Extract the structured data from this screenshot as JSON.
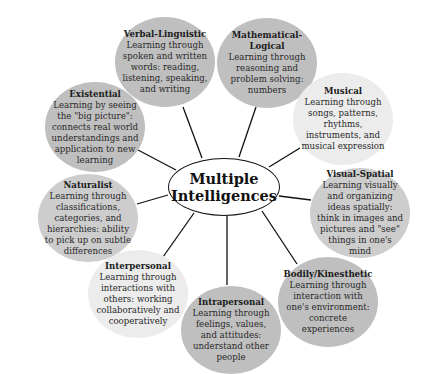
{
  "center": {
    "line1": "Multiple",
    "line2": "Intelligences"
  },
  "colors": {
    "dark": "#bfbfbf",
    "medium": "#cdcdcd",
    "light": "#ececec",
    "line": "#111111"
  },
  "nodes": [
    {
      "id": "verbal",
      "title": "Verbal-Linguistic",
      "desc": "Learning through spoken and written words: reading, listening, speaking, and writing",
      "cx": 165,
      "cy": 62,
      "rx": 50,
      "ry": 45,
      "shade": "dark"
    },
    {
      "id": "math",
      "title": "Mathematical-Logical",
      "desc": "Learning through reasoning and problem solving: numbers",
      "cx": 267,
      "cy": 63,
      "rx": 50,
      "ry": 45,
      "shade": "dark"
    },
    {
      "id": "musical",
      "title": "Musical",
      "desc": "Learning through songs, patterns, rhythms, instruments, and musical expression",
      "cx": 343,
      "cy": 119,
      "rx": 50,
      "ry": 46,
      "shade": "light"
    },
    {
      "id": "visual",
      "title": "Visual-Spatial",
      "desc": "Learning visually and organizing ideas spatially: think in images and pictures and \"see\" things in one's mind",
      "cx": 360,
      "cy": 213,
      "rx": 50,
      "ry": 45,
      "shade": "medium"
    },
    {
      "id": "bodily",
      "title": "Bodily/Kinesthetic",
      "desc": "Learning through interaction with one's environment: concrete experiences",
      "cx": 328,
      "cy": 302,
      "rx": 50,
      "ry": 45,
      "shade": "dark"
    },
    {
      "id": "intra",
      "title": "Intrapersonal",
      "desc": "Learning through feelings, values, and attitudes: understand other people",
      "cx": 231,
      "cy": 330,
      "rx": 50,
      "ry": 44,
      "shade": "dark"
    },
    {
      "id": "inter",
      "title": "Interpersonal",
      "desc": "Learning through interactions with others: working collaboratively and cooperatively",
      "cx": 138,
      "cy": 294,
      "rx": 50,
      "ry": 44,
      "shade": "light"
    },
    {
      "id": "naturalist",
      "title": "Naturalist",
      "desc": "Learning through classifications, categories, and hierarchies: ability to pick up on subtle differences",
      "cx": 88,
      "cy": 218,
      "rx": 50,
      "ry": 44,
      "shade": "medium"
    },
    {
      "id": "existential",
      "title": "Existential",
      "desc": "Learning by seeing the \"big picture\": connects real world understandings and application to new learning",
      "cx": 95,
      "cy": 127,
      "rx": 50,
      "ry": 45,
      "shade": "dark"
    }
  ],
  "connectors": [
    {
      "to": "verbal",
      "x1": 202,
      "y1": 158,
      "x2": 183,
      "y2": 107
    },
    {
      "to": "math",
      "x1": 239,
      "y1": 157,
      "x2": 256,
      "y2": 107
    },
    {
      "to": "musical",
      "x1": 269,
      "y1": 167,
      "x2": 300,
      "y2": 148
    },
    {
      "to": "visual",
      "x1": 279,
      "y1": 196,
      "x2": 311,
      "y2": 200
    },
    {
      "to": "bodily",
      "x1": 262,
      "y1": 211,
      "x2": 297,
      "y2": 264
    },
    {
      "to": "intra",
      "x1": 227,
      "y1": 216,
      "x2": 227,
      "y2": 285
    },
    {
      "to": "inter",
      "x1": 194,
      "y1": 213,
      "x2": 163,
      "y2": 257
    },
    {
      "to": "naturalist",
      "x1": 168,
      "y1": 195,
      "x2": 137,
      "y2": 204
    },
    {
      "to": "existential",
      "x1": 176,
      "y1": 170,
      "x2": 138,
      "y2": 150
    }
  ]
}
